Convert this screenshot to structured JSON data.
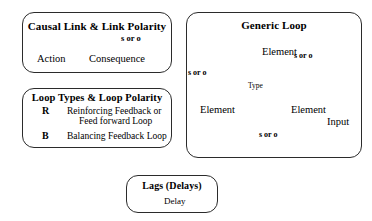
{
  "diagram": {
    "background_color": "#ffffff",
    "stroke_color": "#000000",
    "border_color": "#2b2b2b"
  },
  "causal_link_panel": {
    "title": "Causal Link & Link Polarity",
    "source_label": "Action",
    "target_label": "Consequence",
    "polarity_label": "s  or  o",
    "arrow_description": "curved arrow from Action to Consequence"
  },
  "loop_types_panel": {
    "title": "Loop Types & Loop Polarity",
    "entries": [
      {
        "badge": "R",
        "badge_icon": "circular-arrow-icon",
        "line1": "Reinforcing Feedback  or",
        "line2": "Feed forward Loop"
      },
      {
        "badge": "B",
        "badge_icon": "circular-arrow-icon",
        "line1": "Balancing Feedback Loop",
        "line2": ""
      }
    ]
  },
  "generic_loop_panel": {
    "title": "Generic Loop",
    "nodes": {
      "top": "Element",
      "left": "Element",
      "right": "Element",
      "center": "Type",
      "input": "Input"
    },
    "polarities": {
      "top_left": "s  or  o",
      "top_right": "s  or  o",
      "bottom": "s  or  o"
    }
  },
  "lags_panel": {
    "title": "Lags (Delays)",
    "delay_label": "Delay",
    "symbol": "delay-arrow-icon"
  }
}
